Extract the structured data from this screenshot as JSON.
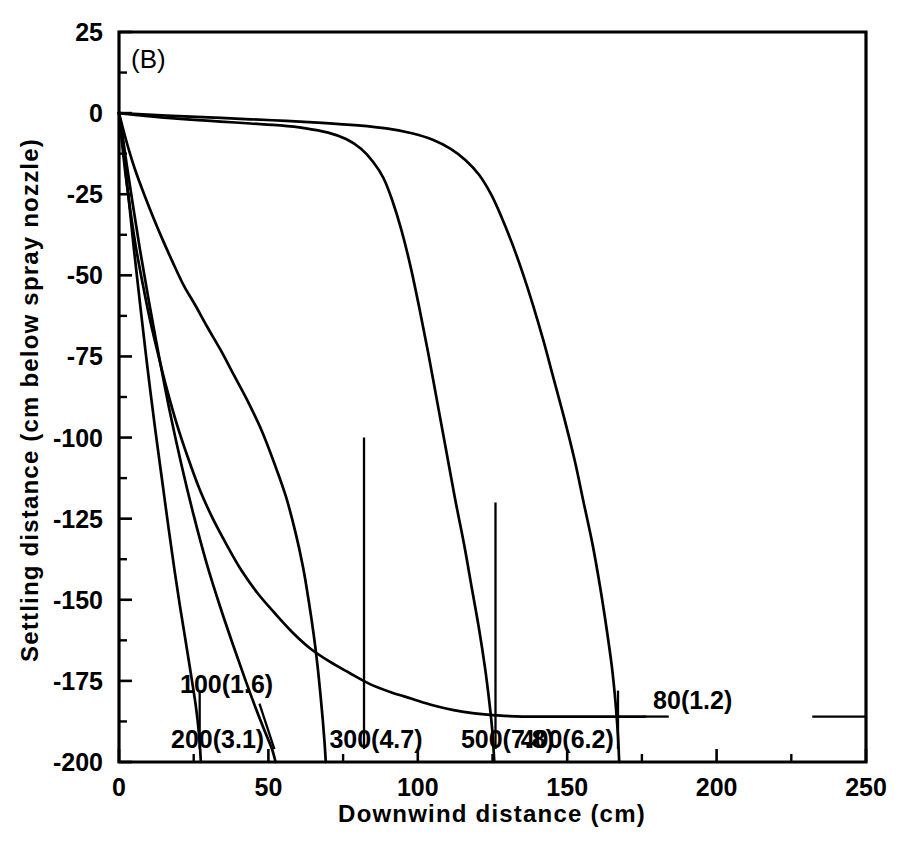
{
  "figure": {
    "panel_label": "(B)",
    "background": "#ffffff",
    "ink_color": "#000000"
  },
  "chart_data": {
    "type": "line",
    "title": "",
    "panel": "(B)",
    "xlabel": "Downwind  distance  (cm)",
    "ylabel": "Settling  distance  (cm below spray nozzle)",
    "xlim": [
      0,
      250
    ],
    "ylim": [
      -200,
      25
    ],
    "grid": false,
    "legend": "inline-curve-labels",
    "x_major_ticks": [
      0,
      50,
      100,
      150,
      200,
      250
    ],
    "x_minor_ticks": [
      25,
      75,
      125,
      175,
      225
    ],
    "x_tick_labels": [
      "0",
      "50",
      "100",
      "150",
      "200",
      "250"
    ],
    "y_major_ticks": [
      25,
      0,
      -25,
      -50,
      -75,
      -100,
      -125,
      -150,
      -175,
      -200
    ],
    "y_minor_ticks": [
      12.5,
      -12.5,
      -37.5,
      -62.5,
      -87.5,
      -112.5,
      -137.5,
      -162.5,
      -187.5
    ],
    "y_tick_labels": [
      "25",
      "0",
      "-25",
      "-50",
      "-75",
      "-100",
      "-125",
      "-150",
      "-175",
      "-200"
    ],
    "series": [
      {
        "name": "200(3.1)",
        "label": "200(3.1)",
        "label_x": 33,
        "label_y": -193,
        "leader": [
          [
            27,
            -178
          ],
          [
            27,
            -196
          ]
        ],
        "points": [
          [
            0,
            0
          ],
          [
            0.8,
            -6
          ],
          [
            1.8,
            -14
          ],
          [
            3.2,
            -26
          ],
          [
            5.0,
            -42
          ],
          [
            7.2,
            -60
          ],
          [
            9.6,
            -79
          ],
          [
            12.2,
            -98
          ],
          [
            14.4,
            -113
          ],
          [
            16.6,
            -128
          ],
          [
            18.6,
            -141
          ],
          [
            20.4,
            -152
          ],
          [
            22.0,
            -161
          ],
          [
            23.4,
            -169
          ],
          [
            24.6,
            -176
          ],
          [
            25.6,
            -182
          ],
          [
            26.4,
            -188
          ],
          [
            27.0,
            -194
          ],
          [
            27.4,
            -200
          ]
        ]
      },
      {
        "name": "100(1.6)",
        "label": "100(1.6)",
        "label_x": 36,
        "label_y": -176,
        "leader": [
          [
            52,
            -196
          ],
          [
            47,
            -182
          ]
        ],
        "points": [
          [
            0,
            0
          ],
          [
            1.2,
            -7
          ],
          [
            2.6,
            -16
          ],
          [
            4.6,
            -28
          ],
          [
            7.0,
            -42
          ],
          [
            10.0,
            -58
          ],
          [
            13.4,
            -75
          ],
          [
            17.0,
            -92
          ],
          [
            20.8,
            -108
          ],
          [
            25.0,
            -124
          ],
          [
            29.4,
            -139
          ],
          [
            33.8,
            -152
          ],
          [
            38.2,
            -164
          ],
          [
            42.4,
            -175
          ],
          [
            46.0,
            -184
          ],
          [
            49.0,
            -191
          ],
          [
            51.2,
            -196
          ],
          [
            52.4,
            -200
          ]
        ]
      },
      {
        "name": "300(4.7)",
        "label": "300(4.7)",
        "label_x": 86,
        "label_y": -193,
        "leader": [
          [
            82,
            -100
          ],
          [
            82,
            -196
          ]
        ],
        "points": [
          [
            0,
            0
          ],
          [
            1.4,
            -5
          ],
          [
            3.2,
            -11
          ],
          [
            5.6,
            -18
          ],
          [
            8.4,
            -25
          ],
          [
            11.4,
            -32
          ],
          [
            14.6,
            -39
          ],
          [
            18.0,
            -46
          ],
          [
            21.6,
            -53
          ],
          [
            25.4,
            -59
          ],
          [
            29.6,
            -66
          ],
          [
            34.0,
            -73
          ],
          [
            38.6,
            -81
          ],
          [
            43.2,
            -89
          ],
          [
            47.8,
            -98
          ],
          [
            52.0,
            -108
          ],
          [
            55.8,
            -118
          ],
          [
            59.0,
            -129
          ],
          [
            61.6,
            -140
          ],
          [
            63.6,
            -151
          ],
          [
            65.2,
            -161
          ],
          [
            66.4,
            -170
          ],
          [
            67.4,
            -179
          ],
          [
            68.2,
            -187
          ],
          [
            68.8,
            -194
          ],
          [
            69.2,
            -200
          ]
        ]
      },
      {
        "name": "500(7.8)",
        "label": "500(7.8)",
        "label_x": 130,
        "label_y": -193,
        "leader": [
          [
            126,
            -120
          ],
          [
            126,
            -196
          ]
        ],
        "points": [
          [
            0,
            0
          ],
          [
            6,
            -0.6
          ],
          [
            14,
            -1.3
          ],
          [
            24,
            -2.0
          ],
          [
            34,
            -2.6
          ],
          [
            44,
            -3.2
          ],
          [
            54,
            -3.8
          ],
          [
            62,
            -4.6
          ],
          [
            70,
            -6.0
          ],
          [
            76,
            -8.0
          ],
          [
            81,
            -11.0
          ],
          [
            85,
            -15.0
          ],
          [
            88.5,
            -20.0
          ],
          [
            91.5,
            -27.0
          ],
          [
            94.5,
            -36.0
          ],
          [
            97.5,
            -47.0
          ],
          [
            100.5,
            -60.0
          ],
          [
            103.5,
            -74.0
          ],
          [
            106.5,
            -89.0
          ],
          [
            109.5,
            -104.0
          ],
          [
            112.5,
            -119.0
          ],
          [
            115.5,
            -133.0
          ],
          [
            118.0,
            -146.0
          ],
          [
            120.5,
            -159.0
          ],
          [
            122.5,
            -171.0
          ],
          [
            124.0,
            -182.0
          ],
          [
            125.0,
            -191.0
          ],
          [
            125.6,
            -200
          ]
        ]
      },
      {
        "name": "400(6.2)",
        "label": "400(6.2)",
        "label_x": 150,
        "label_y": -193,
        "leader": [
          [
            167,
            -178
          ],
          [
            167,
            -196
          ]
        ],
        "points": [
          [
            0,
            0
          ],
          [
            8,
            -0.4
          ],
          [
            20,
            -0.9
          ],
          [
            32,
            -1.4
          ],
          [
            44,
            -1.9
          ],
          [
            56,
            -2.4
          ],
          [
            68,
            -3.0
          ],
          [
            80,
            -3.8
          ],
          [
            90,
            -4.8
          ],
          [
            98,
            -6.2
          ],
          [
            105,
            -8.2
          ],
          [
            111,
            -11.0
          ],
          [
            116,
            -14.5
          ],
          [
            120.5,
            -19.0
          ],
          [
            124.5,
            -25.0
          ],
          [
            128,
            -32.0
          ],
          [
            131.5,
            -40.0
          ],
          [
            135,
            -49.0
          ],
          [
            138.5,
            -59.0
          ],
          [
            142,
            -70.0
          ],
          [
            145.5,
            -82.0
          ],
          [
            149,
            -94.0
          ],
          [
            152.5,
            -107.0
          ],
          [
            155.5,
            -120.0
          ],
          [
            158.5,
            -133.0
          ],
          [
            161,
            -146.0
          ],
          [
            163.2,
            -159.0
          ],
          [
            165,
            -171.0
          ],
          [
            166.2,
            -182.0
          ],
          [
            167.0,
            -192.0
          ],
          [
            167.4,
            -200
          ]
        ]
      },
      {
        "name": "80(1.2)",
        "label": "80(1.2)",
        "label_x": 192,
        "label_y": -181,
        "leader_left": [
          [
            176,
            -186
          ],
          [
            184,
            -186
          ]
        ],
        "leader_right": [
          [
            232,
            -186
          ],
          [
            250,
            -186
          ]
        ],
        "points": [
          [
            0,
            0
          ],
          [
            1.0,
            -9
          ],
          [
            2.2,
            -19
          ],
          [
            3.8,
            -30
          ],
          [
            5.6,
            -41
          ],
          [
            7.8,
            -52
          ],
          [
            10.2,
            -63
          ],
          [
            13.0,
            -74
          ],
          [
            16.0,
            -85
          ],
          [
            19.4,
            -96
          ],
          [
            23.0,
            -106
          ],
          [
            27.0,
            -116
          ],
          [
            31.4,
            -125
          ],
          [
            36.0,
            -133
          ],
          [
            41.0,
            -141
          ],
          [
            46.4,
            -148
          ],
          [
            52.0,
            -154
          ],
          [
            58.0,
            -160
          ],
          [
            64.0,
            -165
          ],
          [
            70.4,
            -169
          ],
          [
            77.0,
            -172.5
          ],
          [
            84.0,
            -176
          ],
          [
            91.0,
            -178.5
          ],
          [
            98.0,
            -180.5
          ],
          [
            105.0,
            -182.5
          ],
          [
            112.0,
            -184
          ],
          [
            119.0,
            -185
          ],
          [
            126.0,
            -185.6
          ],
          [
            135.0,
            -186
          ],
          [
            150.0,
            -186
          ],
          [
            176.0,
            -186
          ]
        ]
      }
    ]
  }
}
